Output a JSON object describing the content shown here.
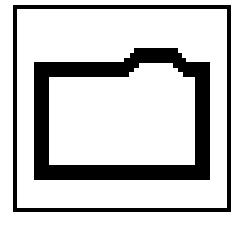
{
  "icon": {
    "name": "folder-icon",
    "label": "Folder",
    "frame_color": "#000000",
    "fill_color": "#ffffff",
    "stroke_color": "#000000"
  }
}
